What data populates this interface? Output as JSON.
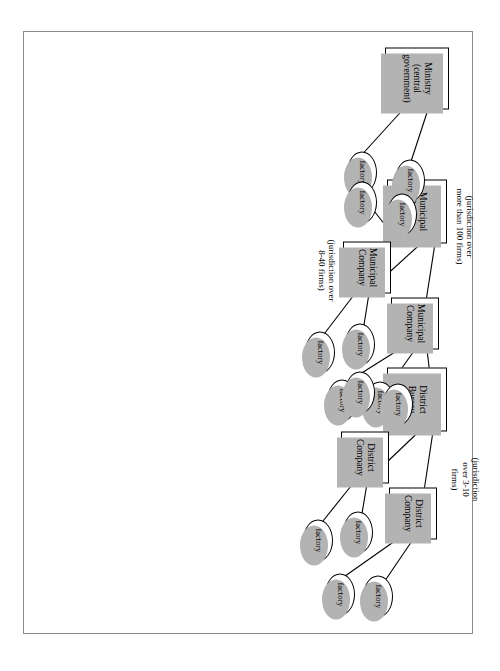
{
  "figure": {
    "type": "organization-hierarchy-diagram",
    "orientation": "rotated-90-clockwise",
    "frame_color": "#8c8c8c",
    "node_border_color": "#000000",
    "node_fill_color": "#ffffff",
    "shadow_color": "#b3b3b3"
  },
  "nodes": {
    "ministry": {
      "label": "Ministry\n(central government)",
      "shape": "box"
    },
    "municipal_bureau": {
      "label": "Municipal Bureau",
      "shape": "box"
    },
    "district_bureau": {
      "label": "District Bureau",
      "shape": "box"
    },
    "municipal_company_1": {
      "label": "Municipal\nCompany",
      "shape": "box"
    },
    "municipal_company_2": {
      "label": "Municipal\nCompany",
      "shape": "box"
    },
    "district_company_1": {
      "label": "District\nCompany",
      "shape": "box"
    },
    "district_company_2": {
      "label": "District\nCompany",
      "shape": "box"
    },
    "factory": {
      "label": "factory",
      "shape": "ellipse"
    }
  },
  "factories": [
    {
      "id": "f_min_1",
      "label": "factory",
      "parent": "ministry"
    },
    {
      "id": "f_min_2",
      "label": "factory",
      "parent": "ministry"
    },
    {
      "id": "f_mb_1",
      "label": "factory",
      "parent": "municipal_bureau"
    },
    {
      "id": "f_mb_2",
      "label": "factory",
      "parent": "municipal_bureau"
    },
    {
      "id": "f_mc1_1",
      "label": "factory",
      "parent": "municipal_company_1"
    },
    {
      "id": "f_mc1_2",
      "label": "factory",
      "parent": "municipal_company_1"
    },
    {
      "id": "f_mc2_1",
      "label": "factory",
      "parent": "municipal_company_2"
    },
    {
      "id": "f_mc2_2",
      "label": "factory",
      "parent": "municipal_company_2"
    },
    {
      "id": "f_db_1",
      "label": "factory",
      "parent": "district_bureau"
    },
    {
      "id": "f_db_2",
      "label": "factory",
      "parent": "district_bureau"
    },
    {
      "id": "f_dc1_1",
      "label": "factory",
      "parent": "district_company_1"
    },
    {
      "id": "f_dc1_2",
      "label": "factory",
      "parent": "district_company_1"
    },
    {
      "id": "f_dc2_1",
      "label": "factory",
      "parent": "district_company_2"
    },
    {
      "id": "f_dc2_2",
      "label": "factory",
      "parent": "district_company_2"
    }
  ],
  "annotations": {
    "municipal_bureau_note": "(jurisdiction over\nmore than 100 firms)",
    "municipal_company_note": "(jurisdiction over\n8-40 firms)",
    "district_company_note": "(jurisdiction\nover 3-10\nfirms)"
  },
  "edges": [
    {
      "from": "ministry",
      "to": "f_min_1"
    },
    {
      "from": "ministry",
      "to": "f_min_2"
    },
    {
      "from": "ministry",
      "to": "municipal_bureau"
    },
    {
      "from": "municipal_bureau",
      "to": "f_mb_1"
    },
    {
      "from": "municipal_bureau",
      "to": "f_mb_2"
    },
    {
      "from": "municipal_bureau",
      "to": "municipal_company_1"
    },
    {
      "from": "municipal_bureau",
      "to": "municipal_company_2"
    },
    {
      "from": "municipal_company_1",
      "to": "f_mc1_1"
    },
    {
      "from": "municipal_company_1",
      "to": "f_mc1_2"
    },
    {
      "from": "municipal_company_2",
      "to": "f_mc2_1"
    },
    {
      "from": "municipal_company_2",
      "to": "f_mc2_2"
    },
    {
      "from": "municipal_company_2",
      "to": "district_bureau"
    },
    {
      "from": "district_bureau",
      "to": "f_db_1"
    },
    {
      "from": "district_bureau",
      "to": "f_db_2"
    },
    {
      "from": "district_bureau",
      "to": "district_company_1"
    },
    {
      "from": "district_bureau",
      "to": "district_company_2"
    },
    {
      "from": "district_company_1",
      "to": "f_dc1_1"
    },
    {
      "from": "district_company_1",
      "to": "f_dc1_2"
    },
    {
      "from": "district_company_2",
      "to": "f_dc2_1"
    },
    {
      "from": "district_company_2",
      "to": "f_dc2_2"
    }
  ]
}
